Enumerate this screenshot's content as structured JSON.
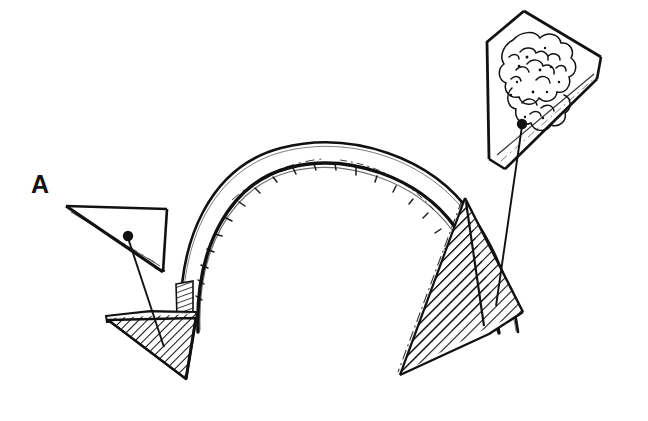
{
  "figure": {
    "label": "A",
    "background_color": "#ffffff",
    "ink_color": "#111111",
    "width": 648,
    "height": 421,
    "style": "hand-drawn pen-and-ink technical line illustration"
  },
  "labels": [
    {
      "id": "label-a",
      "text": "A",
      "x": 31,
      "y": 172,
      "font_size": 25,
      "weight": "bold"
    }
  ],
  "elements": {
    "arch": {
      "name": "arch-band",
      "description": "Hand-drawn semicircular arch band spanning the figure center",
      "outer_path": "M 180 330 C 176 238 212 168 280 150 C 348 132 430 158 470 215 C 500 258 512 300 516 330",
      "inner_path": "M 196 330 C 193 248 226 185 285 169 C 344 153 416 176 452 226 C 479 264 493 300 498 332",
      "stroke_color": "#111111",
      "fill": "none"
    },
    "left_base": {
      "name": "left-base-wedge",
      "description": "Downward pointing hatched triangular base at the left springing of the arch",
      "points": "108,318 196,314 186,379",
      "hatch": "diagonal",
      "hatch_angle": 45
    },
    "left_springing_hatch": {
      "name": "left-springing-hatch",
      "description": "Small hatched sliver where the arch meets the left base",
      "points": "176,285 192,282 192,318 178,318"
    },
    "right_wedge": {
      "name": "right-hatched-wedge",
      "description": "Large hatched triangular wedge cutting the right haunch of the arch, with two facets",
      "facet_a": "465,200 492,297 400,374",
      "facet_b": "465,200 523,312 400,374",
      "divider": "M 465 200 L 483 322",
      "hatch": "diagonal",
      "hatch_angle": 45
    },
    "callout_left": {
      "name": "left-detail-callout",
      "description": "Small plain wedge magnifier showing a smooth sample surface",
      "outline": "66,207 166,209 163,271 74,216",
      "inner_edge": "M 70 213 L 160 265",
      "dot": {
        "x": 128,
        "y": 237,
        "r": 5
      },
      "leader_line": "M 128 237 L 163 345"
    },
    "callout_right": {
      "name": "right-detail-callout",
      "description": "Large wedge magnifier showing granular cloud-like texture of the material",
      "outline": "524,11 601,58 596,78 503,168 489,161 487,42",
      "inner_edge": "M 497 156 L 594 75",
      "texture": "granular cloud-like cauliflower stipple blob",
      "dot": {
        "x": 522,
        "y": 124,
        "r": 5
      },
      "leader_line": "M 522 124 L 495 305"
    }
  },
  "legend": {
    "hatched_meaning": "cut / sectioned material",
    "plain_meaning": "uncut surface",
    "textured_meaning": "granular inclusion texture"
  }
}
